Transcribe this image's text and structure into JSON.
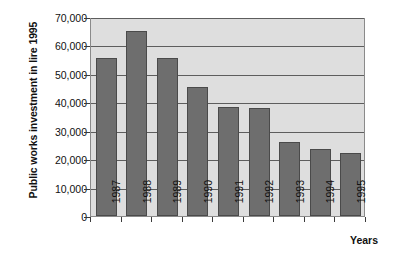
{
  "chart_data": {
    "type": "bar",
    "title": "",
    "xlabel": "Years",
    "ylabel": "Public works investment in lire 1995",
    "categories": [
      "1987",
      "1988",
      "1989",
      "1990",
      "1991",
      "1992",
      "1993",
      "1994",
      "1995"
    ],
    "values": [
      55500,
      65000,
      55500,
      45500,
      38500,
      38000,
      26000,
      23500,
      22000
    ],
    "ylim": [
      0,
      70000
    ],
    "yticks": [
      0,
      10000,
      20000,
      30000,
      40000,
      50000,
      60000,
      70000
    ],
    "ytick_labels": [
      "0",
      "10,000",
      "20,000",
      "30,000",
      "40,000",
      "50,000",
      "60,000",
      "70,000"
    ],
    "grid": true,
    "legend": false,
    "bar_color": "#6e6e6e",
    "bar_edge_color": "#4a4a4a",
    "plot_background": "#dedede",
    "gridline_color": "#5d5d5d",
    "axis_color": "#3a3a3a"
  }
}
